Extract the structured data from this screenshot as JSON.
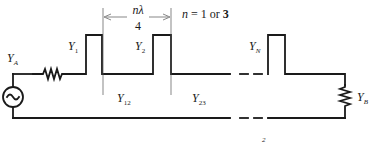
{
  "diagram": {
    "source_label": {
      "main": "Y",
      "sub": "A"
    },
    "load_label": {
      "main": "Y",
      "sub": "B"
    },
    "stubs": [
      {
        "main": "Y",
        "sub": "1"
      },
      {
        "main": "Y",
        "sub": "2"
      },
      {
        "main": "Y",
        "sub": "N"
      }
    ],
    "lines": [
      {
        "main": "Y",
        "sub": "12"
      },
      {
        "main": "Y",
        "sub": "23"
      }
    ],
    "spacing": {
      "numerator": "nλ",
      "denominator": "4"
    },
    "n_note": {
      "prefix": "n",
      "eq": " = 1 ",
      "or": "or ",
      "alt": "3"
    },
    "page_mark": "2"
  }
}
